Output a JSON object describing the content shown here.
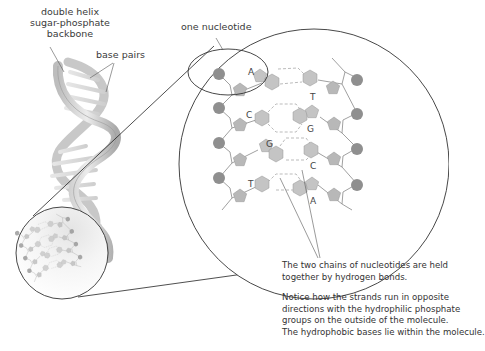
{
  "labels": {
    "backbone": [
      "double helix",
      "sugar-phosphate",
      "backbone"
    ],
    "base_pairs": "base pairs",
    "nucleotide": "one nucleotide"
  },
  "base_pairs": [
    {
      "left": "A",
      "right": "T"
    },
    {
      "left": "C",
      "right": "G"
    },
    {
      "left": "G",
      "right": "C"
    },
    {
      "left": "T",
      "right": "A"
    }
  ],
  "captions": {
    "hydrogen_bonds": [
      "The two chains of nucleotides are held",
      "together by hydrogen bonds."
    ],
    "orientation": [
      "Notice how the strands run in opposite",
      "directions with the hydrophilic phosphate",
      "groups on the outside of the molecule.",
      "The hydrophobic bases lie within the molecule."
    ]
  },
  "colors": {
    "phosphate": "#8f8f8f",
    "sugar": "#b8b8b8",
    "base": "#c4c4c4",
    "outline": "#444444",
    "helix": "#d9d9d9",
    "background": "#ffffff"
  }
}
